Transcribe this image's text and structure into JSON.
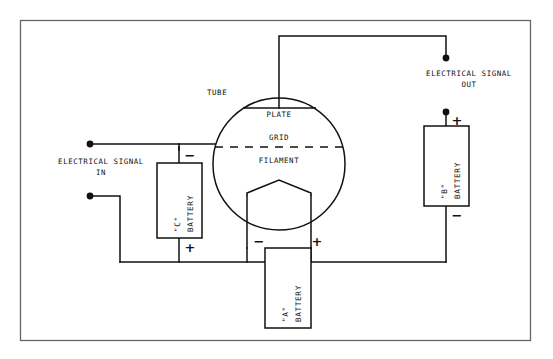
{
  "diagram": {
    "title_visible": false,
    "type": "vacuum-tube-triode-amplifier-schematic",
    "frame": {
      "x": 20,
      "y": 20,
      "w": 510,
      "h": 320,
      "color": "#555555"
    },
    "line_color": "#111111"
  },
  "labels": {
    "tube": "TUBE",
    "plate": "PLATE",
    "grid": "GRID",
    "filament": "FILAMENT",
    "signal_in_line1": "ELECTRICAL SIGNAL",
    "signal_in_line2": "IN",
    "signal_out_line1": "ELECTRICAL SIGNAL",
    "signal_out_line2": "OUT"
  },
  "batteries": [
    {
      "id": "c-battery",
      "name_quote": "\"C\"",
      "name_word": "BATTERY",
      "box": {
        "x": 157,
        "y": 163,
        "w": 45,
        "h": 75
      },
      "top_terminal": "−",
      "bottom_terminal": "+"
    },
    {
      "id": "b-battery",
      "name_quote": "\"B\"",
      "name_word": "BATTERY",
      "box": {
        "x": 424,
        "y": 126,
        "w": 45,
        "h": 80
      },
      "top_terminal": "+",
      "bottom_terminal": "−"
    },
    {
      "id": "a-battery",
      "name_quote": "\"A\"",
      "name_word": "BATTERY",
      "box": {
        "x": 265,
        "y": 248,
        "w": 46,
        "h": 80
      },
      "left_terminal": "−",
      "right_terminal": "+"
    }
  ],
  "terminals": [
    {
      "id": "signal-in-top",
      "x": 90,
      "y": 144
    },
    {
      "id": "signal-in-bottom",
      "x": 90,
      "y": 196
    },
    {
      "id": "signal-out-top",
      "x": 446,
      "y": 58
    },
    {
      "id": "signal-out-bottom",
      "x": 446,
      "y": 112
    }
  ],
  "tube": {
    "circle": {
      "cx": 279,
      "cy": 164,
      "r": 66
    },
    "plate_line": {
      "x1": 243,
      "x2": 316,
      "y": 108
    },
    "grid_dashed": {
      "x1": 213,
      "x2": 345,
      "y": 147
    },
    "filament_apex": {
      "x": 279,
      "y": 180
    }
  }
}
